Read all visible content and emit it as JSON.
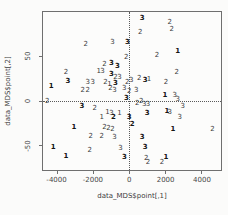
{
  "chart_data": {
    "type": "scatter",
    "point_style": "text-labels",
    "title": "",
    "xlabel": "data_MDS$point[,1]",
    "ylabel": "data_MDS$point[,2]",
    "xlim": [
      -4800,
      5100
    ],
    "ylim": [
      -78,
      100
    ],
    "x_ticks": [
      -4000,
      -2000,
      0,
      2000,
      4000
    ],
    "y_ticks": [
      -50,
      0,
      50
    ],
    "grid": false,
    "legend": "none",
    "reference_lines": {
      "h": 0,
      "v": 0,
      "style": "dotted"
    },
    "points": [
      {
        "l": "3",
        "x": 715,
        "y": 93,
        "b": true
      },
      {
        "l": "2",
        "x": 2255,
        "y": 89
      },
      {
        "l": "2",
        "x": 605,
        "y": 78
      },
      {
        "l": "2",
        "x": -2420,
        "y": 64
      },
      {
        "l": "3",
        "x": -935,
        "y": 66
      },
      {
        "l": "3",
        "x": -110,
        "y": 66,
        "b": true
      },
      {
        "l": "2",
        "x": -165,
        "y": 49
      },
      {
        "l": "2",
        "x": 1540,
        "y": 52
      },
      {
        "l": "1",
        "x": 2695,
        "y": 56,
        "b": true
      },
      {
        "l": "2",
        "x": 2365,
        "y": 81
      },
      {
        "l": "2",
        "x": -3520,
        "y": 32
      },
      {
        "l": "3",
        "x": -3410,
        "y": 22,
        "b": true
      },
      {
        "l": "1",
        "x": -4345,
        "y": 17,
        "b": true
      },
      {
        "l": "3",
        "x": -2310,
        "y": 21
      },
      {
        "l": "3",
        "x": -2035,
        "y": 21
      },
      {
        "l": "2",
        "x": -2585,
        "y": 12
      },
      {
        "l": "2",
        "x": -2310,
        "y": 12
      },
      {
        "l": "2",
        "x": -1375,
        "y": 41
      },
      {
        "l": "3",
        "x": -990,
        "y": 42,
        "b": true
      },
      {
        "l": "1",
        "x": -1705,
        "y": 33
      },
      {
        "l": "3",
        "x": -1485,
        "y": 34
      },
      {
        "l": "3",
        "x": -660,
        "y": 39,
        "b": true
      },
      {
        "l": "3",
        "x": -990,
        "y": 30,
        "b": true
      },
      {
        "l": "2",
        "x": -770,
        "y": 27
      },
      {
        "l": "3",
        "x": -550,
        "y": 27
      },
      {
        "l": "2",
        "x": -1320,
        "y": 21
      },
      {
        "l": "1",
        "x": -1100,
        "y": 19
      },
      {
        "l": "3",
        "x": -770,
        "y": 20,
        "b": true
      },
      {
        "l": "2",
        "x": -110,
        "y": 21
      },
      {
        "l": "3",
        "x": 110,
        "y": 23
      },
      {
        "l": "2",
        "x": 550,
        "y": 26
      },
      {
        "l": "3",
        "x": 880,
        "y": 23,
        "b": true
      },
      {
        "l": "1",
        "x": 1100,
        "y": 24
      },
      {
        "l": "2",
        "x": 2640,
        "y": 32
      },
      {
        "l": "2",
        "x": 2035,
        "y": 21
      },
      {
        "l": "2",
        "x": -4565,
        "y": 0
      },
      {
        "l": "2",
        "x": -1045,
        "y": 14
      },
      {
        "l": "3",
        "x": -825,
        "y": 12
      },
      {
        "l": "3",
        "x": -275,
        "y": 14
      },
      {
        "l": "2",
        "x": 0,
        "y": 11
      },
      {
        "l": "3",
        "x": 385,
        "y": 12
      },
      {
        "l": "3",
        "x": -165,
        "y": 3,
        "b": true
      },
      {
        "l": "2",
        "x": 660,
        "y": 0
      },
      {
        "l": "1",
        "x": 1980,
        "y": 6,
        "b": true
      },
      {
        "l": "3",
        "x": 2530,
        "y": 6
      },
      {
        "l": "3",
        "x": 2695,
        "y": 2
      },
      {
        "l": "3",
        "x": -2640,
        "y": -6,
        "b": true
      },
      {
        "l": "2",
        "x": -1925,
        "y": -8
      },
      {
        "l": "2",
        "x": 440,
        "y": -2
      },
      {
        "l": "3",
        "x": 825,
        "y": -4
      },
      {
        "l": "3",
        "x": 1045,
        "y": -4
      },
      {
        "l": "1",
        "x": -1540,
        "y": -18
      },
      {
        "l": "1",
        "x": -1210,
        "y": -13
      },
      {
        "l": "3",
        "x": -990,
        "y": -14
      },
      {
        "l": "2",
        "x": -880,
        "y": -18,
        "b": true
      },
      {
        "l": "1",
        "x": -550,
        "y": -14
      },
      {
        "l": "3",
        "x": 0,
        "y": -18,
        "b": true
      },
      {
        "l": "3",
        "x": 990,
        "y": -14,
        "b": true
      },
      {
        "l": "3",
        "x": 2970,
        "y": -6
      },
      {
        "l": "1",
        "x": 2090,
        "y": -12,
        "b": true
      },
      {
        "l": "3",
        "x": 2255,
        "y": -13
      },
      {
        "l": "3",
        "x": 2805,
        "y": -18
      },
      {
        "l": "2",
        "x": 165,
        "y": -26,
        "b": true
      },
      {
        "l": "1",
        "x": -3080,
        "y": -30,
        "b": true
      },
      {
        "l": "2",
        "x": -1375,
        "y": -30
      },
      {
        "l": "2",
        "x": -1155,
        "y": -31
      },
      {
        "l": "2",
        "x": -935,
        "y": -32
      },
      {
        "l": "3",
        "x": -825,
        "y": -41
      },
      {
        "l": "2",
        "x": -2145,
        "y": -40
      },
      {
        "l": "2",
        "x": -1540,
        "y": -40
      },
      {
        "l": "3",
        "x": 715,
        "y": -41,
        "b": true
      },
      {
        "l": "1",
        "x": 2420,
        "y": -32,
        "b": true
      },
      {
        "l": "2",
        "x": 4620,
        "y": -32
      },
      {
        "l": "1",
        "x": -4235,
        "y": -52,
        "b": true
      },
      {
        "l": "2",
        "x": -2200,
        "y": -56
      },
      {
        "l": "1",
        "x": -3520,
        "y": -62,
        "b": true
      },
      {
        "l": "3",
        "x": -495,
        "y": -53
      },
      {
        "l": "3",
        "x": -275,
        "y": -63,
        "b": true
      },
      {
        "l": "3",
        "x": 880,
        "y": -52,
        "b": true
      },
      {
        "l": "2",
        "x": 935,
        "y": -64
      },
      {
        "l": "2",
        "x": 1045,
        "y": -69
      },
      {
        "l": "2",
        "x": 1815,
        "y": -69
      },
      {
        "l": "1",
        "x": 2035,
        "y": -63,
        "b": true
      }
    ],
    "colors": {
      "point_text": "#3a3a3a",
      "axis": "#6f6f6f",
      "background": "#fbfbfa"
    }
  }
}
